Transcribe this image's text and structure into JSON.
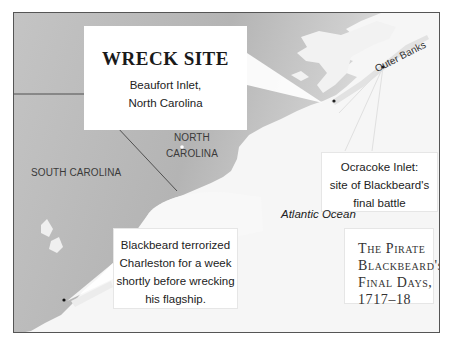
{
  "map": {
    "colors": {
      "land": "#bdbdbd",
      "land_light": "#d9d9d9",
      "ocean": "#f6f6f6",
      "border": "#555555",
      "state_line": "#444444"
    },
    "wreck_site": {
      "title": "WRECK SITE",
      "line1": "Beaufort Inlet,",
      "line2": "North Carolina"
    },
    "states": {
      "north_carolina_1": "NORTH",
      "north_carolina_2": "CAROLINA",
      "south_carolina": "SOUTH CAROLINA"
    },
    "outer_banks": "Outer Banks",
    "ocracoke": {
      "line1": "Ocracoke Inlet:",
      "line2": "site of Blackbeard's",
      "line3": "final battle"
    },
    "ocean_label": "Atlantic Ocean",
    "charleston": {
      "line1": "Blackbeard terrorized",
      "line2": "Charleston for a week",
      "line3": "shortly before wrecking",
      "line4": "his flagship."
    },
    "title_box": {
      "line1": "The Pirate",
      "line2": "Blackbeard's",
      "line3": "Final Days,",
      "line4": "1717–18"
    }
  }
}
